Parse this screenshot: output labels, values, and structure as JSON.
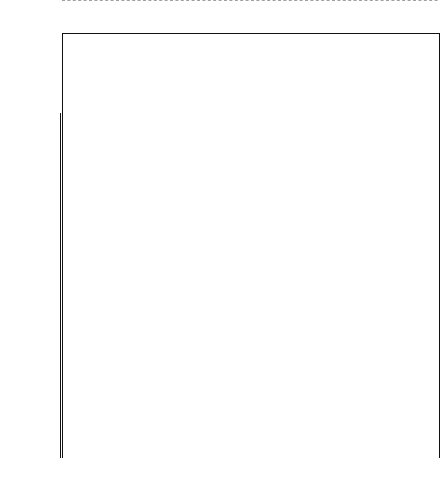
{
  "axis": {
    "symbol": "Z",
    "tick_labels": [
      {
        "value": "0.1014800E03",
        "y": 113
      },
      {
        "value": "0.1051180E03",
        "y": 155
      },
      {
        "value": "0.1104282E03",
        "y": 197
      },
      {
        "value": "0.1145763E03",
        "y": 239
      },
      {
        "value": "0.1181980E03",
        "y": 281
      },
      {
        "value": "0.1212116 E03",
        "y": 323
      },
      {
        "value": "0.1225642E03",
        "y": 351
      },
      {
        "value": "0.1225297E03",
        "y": 362
      },
      {
        "value": "0.1174867E03",
        "y": 399
      },
      {
        "value": "0.1054518E03",
        "y": 428
      },
      {
        "value": "0.6147987E02",
        "y": 456
      }
    ]
  },
  "cut_line": {
    "y": 357,
    "style": "dashed"
  },
  "groups": [
    {
      "numeral": "I",
      "x": 66,
      "width": 52
    },
    {
      "numeral": "V",
      "x": 120,
      "width": 16
    },
    {
      "numeral": "II",
      "x": 138,
      "width": 30
    },
    {
      "numeral": "III",
      "x": 170,
      "width": 24
    },
    {
      "numeral": "IV",
      "x": 196,
      "width": 48
    },
    {
      "numeral": "VI",
      "x": 246,
      "width": 96
    },
    {
      "numeral": "VII",
      "x": 344,
      "width": 32
    },
    {
      "numeral": "VIII",
      "x": 378,
      "width": 22
    }
  ],
  "leaves": [
    {
      "label": "Take From",
      "x": 70
    },
    {
      "label": "Head Display",
      "x": 76
    },
    {
      "label": "Head Down",
      "x": 82
    },
    {
      "label": "Circle",
      "x": 88
    },
    {
      "label": "Jump Over - Cabl",
      "x": 95
    },
    {
      "label": "Jump Over - NC",
      "x": 101
    },
    {
      "label": "Stoop",
      "x": 108
    },
    {
      "label": "Stops At",
      "x": 114
    },
    {
      "label": "Play Face",
      "x": 122
    },
    {
      "label": "Head Under",
      "x": 130
    },
    {
      "label": "Jump On",
      "x": 141
    },
    {
      "label": "Pull/Grab",
      "x": 148
    },
    {
      "label": "Tail Pull",
      "x": 155
    },
    {
      "label": "Hold",
      "x": 163
    },
    {
      "label": "Pick",
      "x": 172
    },
    {
      "label": "Grapple",
      "x": 179
    },
    {
      "label": "Mouth",
      "x": 185
    },
    {
      "label": "Roll Onto Back",
      "x": 191
    },
    {
      "label": "Wrestle",
      "x": 198
    },
    {
      "label": "Crouch Stare",
      "x": 206
    },
    {
      "label": "Head Over Shoulder",
      "x": 213
    },
    {
      "label": "Bounce Charge",
      "x": 220
    },
    {
      "label": "Bounce Chase",
      "x": 227
    },
    {
      "label": "Lateral Bounce Approach",
      "x": 234
    },
    {
      "label": "Bounce Approach",
      "x": 241
    },
    {
      "label": "Bounce Avoid",
      "x": 248
    },
    {
      "label": "Maternal Carry",
      "x": 256
    },
    {
      "label": "Present For Groom",
      "x": 265
    },
    {
      "label": "Touch",
      "x": 273
    },
    {
      "label": "Social Investigation",
      "x": 281
    },
    {
      "label": "Sex Present",
      "x": 289
    },
    {
      "label": "Football Position",
      "x": 297
    },
    {
      "label": "Genital Inspection",
      "x": 305
    },
    {
      "label": "Climb On",
      "x": 313
    },
    {
      "label": "Remain On",
      "x": 320
    },
    {
      "label": "Climb Over",
      "x": 327
    },
    {
      "label": "Lateral Approach",
      "x": 339
    },
    {
      "label": "Ankle Clasp",
      "x": 347
    },
    {
      "label": "Rear",
      "x": 355
    },
    {
      "label": "Hip Touch",
      "x": 363
    },
    {
      "label": "Bite",
      "x": 371
    },
    {
      "label": "Chase",
      "x": 381
    },
    {
      "label": "Charge",
      "x": 388
    },
    {
      "label": "Threat",
      "x": 395
    },
    {
      "label": "Avoid",
      "x": 405
    },
    {
      "label": "Squeal",
      "x": 413
    },
    {
      "label": "Approach",
      "x": 421
    }
  ],
  "chart_data": {
    "type": "dendrogram",
    "title": "",
    "ylabel": "Z",
    "orientation": "top-down",
    "n_leaves": 47,
    "axis_range_px": [
      113,
      458
    ],
    "axis_tick_values": [
      "0.1014800E03",
      "0.1051180E03",
      "0.1104282E03",
      "0.1145763E03",
      "0.1181980E03",
      "0.1212116 E03",
      "0.1225642E03",
      "0.1225297E03",
      "0.1174867E03",
      "0.1054518E03",
      "0.6147987E02"
    ],
    "cluster_labels": [
      "I",
      "II",
      "III",
      "IV",
      "V",
      "VI",
      "VII",
      "VIII"
    ],
    "merges": [
      {
        "left": 70,
        "right": 76,
        "y": 122
      },
      {
        "left": 73,
        "right": 82,
        "y": 132
      },
      {
        "left": 77.5,
        "right": 88,
        "y": 145
      },
      {
        "left": 82.7,
        "right": 114,
        "y": 223
      },
      {
        "left": 95,
        "right": 101,
        "y": 168
      },
      {
        "left": 98,
        "right": 108,
        "y": 240
      },
      {
        "left": 98.4,
        "right": 122,
        "y": 256
      },
      {
        "left": 130,
        "right": 141,
        "y": 320
      },
      {
        "left": 148,
        "right": 155,
        "y": 240
      },
      {
        "left": 151.5,
        "right": 163,
        "y": 272
      },
      {
        "left": 157.2,
        "right": 172,
        "y": 300
      },
      {
        "left": 179,
        "right": 185,
        "y": 280
      },
      {
        "left": 182,
        "right": 191,
        "y": 305
      },
      {
        "left": 186.5,
        "right": 198,
        "y": 330
      },
      {
        "left": 206,
        "right": 213,
        "y": 200
      },
      {
        "left": 209.5,
        "right": 220,
        "y": 245
      },
      {
        "left": 214.7,
        "right": 227,
        "y": 268
      },
      {
        "left": 220.8,
        "right": 234,
        "y": 290
      },
      {
        "left": 227.4,
        "right": 241,
        "y": 318
      },
      {
        "left": 248,
        "right": 256,
        "y": 300
      },
      {
        "left": 265,
        "right": 273,
        "y": 285
      },
      {
        "left": 269,
        "right": 281,
        "y": 315
      },
      {
        "left": 289,
        "right": 297,
        "y": 255
      },
      {
        "left": 293,
        "right": 305,
        "y": 290
      },
      {
        "left": 313,
        "right": 320,
        "y": 130
      },
      {
        "left": 316.5,
        "right": 327,
        "y": 215
      },
      {
        "left": 339,
        "right": 347,
        "y": 265
      },
      {
        "left": 343,
        "right": 355,
        "y": 300
      },
      {
        "left": 363,
        "right": 371,
        "y": 330
      },
      {
        "left": 381,
        "right": 388,
        "y": 310
      },
      {
        "left": 384.5,
        "right": 395,
        "y": 340
      },
      {
        "left": 405,
        "right": 413,
        "y": 140
      },
      {
        "left": 409,
        "right": 421,
        "y": 160
      },
      {
        "left": 90.3,
        "right": 128,
        "y": 370
      },
      {
        "left": 109.2,
        "right": 178,
        "y": 382
      },
      {
        "left": 143.6,
        "right": 210,
        "y": 405
      },
      {
        "left": 176.8,
        "right": 258,
        "y": 428
      },
      {
        "left": 277,
        "right": 299,
        "y": 368
      },
      {
        "left": 288,
        "right": 322,
        "y": 392
      },
      {
        "left": 305,
        "right": 349,
        "y": 415
      },
      {
        "left": 327,
        "right": 389,
        "y": 440
      },
      {
        "left": 217.4,
        "right": 358,
        "y": 455
      },
      {
        "left": 367,
        "right": 415,
        "y": 375
      },
      {
        "left": 391,
        "right": 415,
        "y": 398
      }
    ]
  }
}
